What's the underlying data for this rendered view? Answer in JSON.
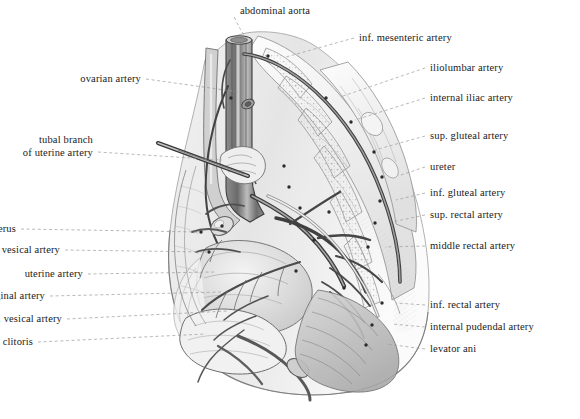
{
  "figure": {
    "style": "grayscale pen-and-ink anatomical illustration",
    "background_color": "#ffffff",
    "ink_color": "#2b2b2b",
    "leader_line_color": "#9a9a9a",
    "text_color": "#1a1a1a"
  },
  "labels": [
    {
      "id": "abdominal-aorta",
      "text": "abdominal aorta",
      "side": "center",
      "x": 275,
      "y": 14,
      "anchor_x": 248,
      "anchor_y": 40
    },
    {
      "id": "inf-mesenteric-artery",
      "text": "inf. mesenteric artery",
      "side": "right",
      "x": 359,
      "y": 41,
      "anchor_x": 286,
      "anchor_y": 57
    },
    {
      "id": "ovarian-artery",
      "text": "ovarian artery",
      "side": "left",
      "x": 141,
      "y": 82,
      "anchor_x": 239,
      "anchor_y": 92
    },
    {
      "id": "iliolumbar-artery",
      "text": "iliolumbar artery",
      "side": "right",
      "x": 430,
      "y": 71,
      "anchor_x": 340,
      "anchor_y": 97
    },
    {
      "id": "internal-iliac-artery",
      "text": "internal iliac artery",
      "side": "right",
      "x": 430,
      "y": 101,
      "anchor_x": 355,
      "anchor_y": 120
    },
    {
      "id": "sup-gluteal-artery",
      "text": "sup. gluteal artery",
      "side": "right",
      "x": 430,
      "y": 139,
      "anchor_x": 375,
      "anchor_y": 150
    },
    {
      "id": "tubal-branch-uterine",
      "text": "tubal branch",
      "text2": "of uterine artery",
      "side": "left",
      "x": 93,
      "y": 143,
      "anchor_x": 222,
      "anchor_y": 160
    },
    {
      "id": "ureter",
      "text": "ureter",
      "side": "right",
      "x": 430,
      "y": 170,
      "anchor_x": 398,
      "anchor_y": 176
    },
    {
      "id": "inf-gluteal-artery",
      "text": "inf. gluteal artery",
      "side": "right",
      "x": 430,
      "y": 196,
      "anchor_x": 396,
      "anchor_y": 200
    },
    {
      "id": "sup-rectal-artery",
      "text": "sup. rectal artery",
      "side": "right",
      "x": 430,
      "y": 218,
      "anchor_x": 392,
      "anchor_y": 222
    },
    {
      "id": "round-ligament-of-uterus",
      "text": "round ligament of uterus",
      "side": "left",
      "x": 16,
      "y": 232,
      "anchor_x": 200,
      "anchor_y": 232
    },
    {
      "id": "middle-rectal-artery",
      "text": "middle rectal artery",
      "side": "right",
      "x": 430,
      "y": 249,
      "anchor_x": 385,
      "anchor_y": 247
    },
    {
      "id": "sup-vesical-artery",
      "text": "sup. vesical artery",
      "side": "left",
      "x": 60,
      "y": 253,
      "anchor_x": 208,
      "anchor_y": 252
    },
    {
      "id": "uterine-artery",
      "text": "uterine artery",
      "side": "left",
      "x": 83,
      "y": 277,
      "anchor_x": 216,
      "anchor_y": 272
    },
    {
      "id": "cervicovaginal-artery",
      "text": "cervicovaginal artery",
      "side": "left",
      "x": 45,
      "y": 299,
      "anchor_x": 222,
      "anchor_y": 292
    },
    {
      "id": "inf-rectal-artery",
      "text": "inf. rectal artery",
      "side": "right",
      "x": 430,
      "y": 308,
      "anchor_x": 396,
      "anchor_y": 303
    },
    {
      "id": "inf-vesical-artery",
      "text": "inf. vesical artery",
      "side": "left",
      "x": 62,
      "y": 322,
      "anchor_x": 228,
      "anchor_y": 311
    },
    {
      "id": "internal-pudendal-artery",
      "text": "internal pudendal artery",
      "side": "right",
      "x": 430,
      "y": 330,
      "anchor_x": 392,
      "anchor_y": 324
    },
    {
      "id": "levator-ani",
      "text": "levator ani",
      "side": "right",
      "x": 430,
      "y": 352,
      "anchor_x": 386,
      "anchor_y": 344
    },
    {
      "id": "dorsal-artery-of-clitoris",
      "text": "dorsal artery of clitoris",
      "side": "left",
      "x": 33,
      "y": 345,
      "anchor_x": 206,
      "anchor_y": 334
    }
  ]
}
